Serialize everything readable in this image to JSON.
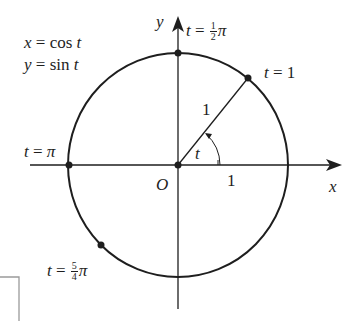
{
  "diagram": {
    "colors": {
      "ink": "#1e1e1e",
      "frame": "#9a9a9a",
      "background": "#ffffff"
    },
    "equations": {
      "line1": "x = cos t",
      "line2": "y = sin t"
    },
    "axes": {
      "x_label": "x",
      "y_label": "y",
      "origin_label": "O"
    },
    "radius_label": "1",
    "x_tick_label": "1",
    "angle_label": "t",
    "points": [
      {
        "name": "t=1/2π",
        "prefix": "t =",
        "frac_num": "1",
        "frac_den": "2",
        "suffix": "π"
      },
      {
        "name": "t=1",
        "text": "t = 1"
      },
      {
        "name": "t=π",
        "text": "t = π"
      },
      {
        "name": "t=5/4π",
        "prefix": "t =",
        "frac_num": "5",
        "frac_den": "4",
        "suffix": "π"
      }
    ]
  }
}
